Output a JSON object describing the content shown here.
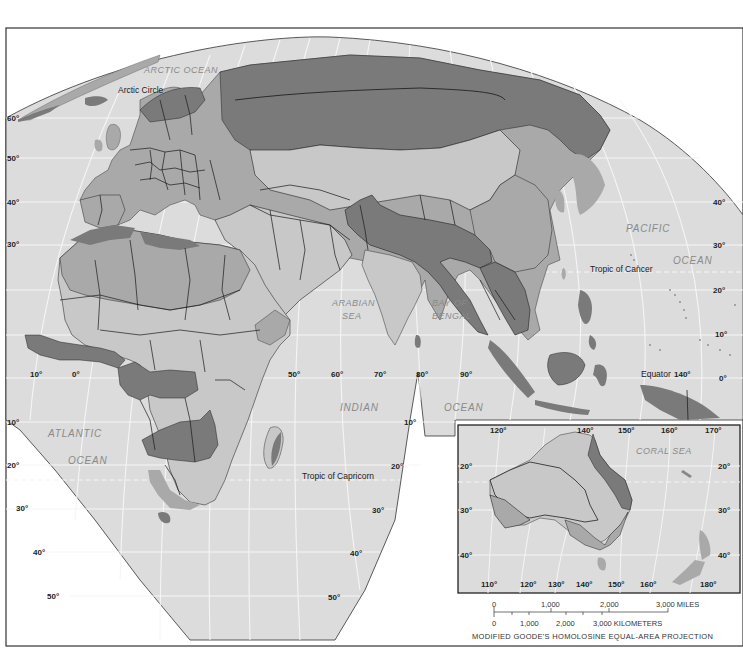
{
  "map": {
    "projection": "MODIFIED GOODE'S HOMOLOSINE EQUAL-AREA PROJECTION",
    "colors": {
      "background": "#ffffff",
      "ocean": "#dcdcdc",
      "graticule": "#f4f4f4",
      "land_light": "#c8c8c8",
      "land_medium": "#a9a9a9",
      "land_dark": "#7a7a7a",
      "border": "#1a1a1a"
    },
    "water_labels": {
      "arctic_ocean": "ARCTIC OCEAN",
      "atlantic_1": "ATLANTIC",
      "atlantic_2": "OCEAN",
      "arabian_1": "ARABIAN",
      "arabian_2": "SEA",
      "bengal_1": "BAY OF",
      "bengal_2": "BENGAL",
      "indian": "INDIAN",
      "indian_ocean": "OCEAN",
      "pacific_1": "PACIFIC",
      "pacific_2": "OCEAN",
      "coral_sea": "CORAL SEA"
    },
    "line_labels": {
      "arctic_circle": "Arctic Circle",
      "tropic_cancer": "Tropic of Cancer",
      "equator": "Equator",
      "tropic_capricorn": "Tropic of Capricorn"
    },
    "latitude_labels_left": [
      "60°",
      "50°",
      "40°",
      "30°",
      "10°",
      "20°",
      "30°",
      "40°",
      "50°"
    ],
    "latitude_labels_right": [
      "40°",
      "30°",
      "20°",
      "10°",
      "0°"
    ],
    "latitude_labels_indian": [
      "10°",
      "20°",
      "30°",
      "40°",
      "50°"
    ],
    "longitude_labels_equator": [
      "10°",
      "0°",
      "50°",
      "60°",
      "70°",
      "80°",
      "90°",
      "140°"
    ],
    "inset": {
      "top_longitudes": [
        "120°",
        "140°",
        "150°",
        "160°",
        "170°"
      ],
      "bottom_longitudes": [
        "110°",
        "120°",
        "130°",
        "140°",
        "150°",
        "160°",
        "180°"
      ],
      "left_latitudes": [
        "20°",
        "30°",
        "40°"
      ],
      "right_latitudes": [
        "20°",
        "30°",
        "40°"
      ]
    },
    "scale": {
      "miles_ticks": [
        "0",
        "1,000",
        "2,000",
        "3,000 MILES"
      ],
      "km_ticks": [
        "0",
        "1,000",
        "2,000",
        "3,000 KILOMETERS"
      ]
    }
  }
}
